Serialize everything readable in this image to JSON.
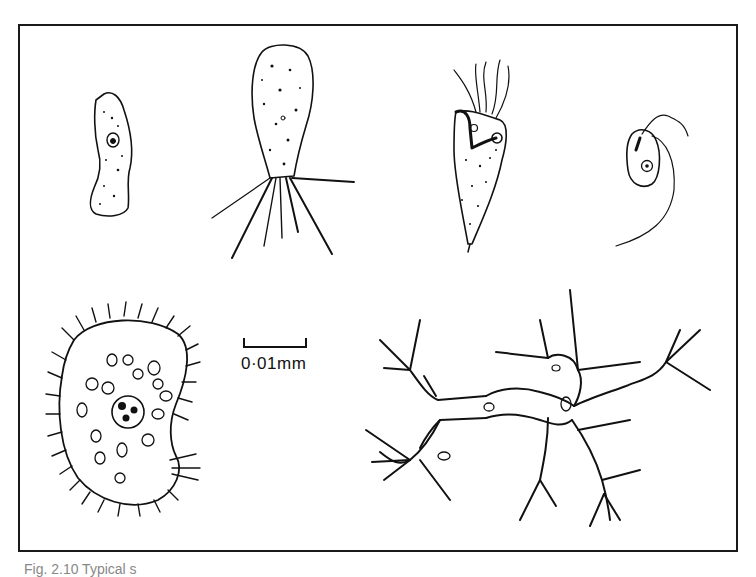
{
  "figure": {
    "scale_bar_label": "0·01mm",
    "caption": "Fig. 2.10  Typical s",
    "panels": [
      {
        "name": "amoeboid-cell",
        "position": "top-left"
      },
      {
        "name": "flagellate-with-posterior-flagella",
        "position": "top-center-left"
      },
      {
        "name": "multiflagellate-trichomonad",
        "position": "top-center-right"
      },
      {
        "name": "small-biflagellate",
        "position": "top-right"
      },
      {
        "name": "ciliate",
        "position": "bottom-left"
      },
      {
        "name": "reticulose-plasmodium",
        "position": "bottom-right"
      }
    ],
    "colors": {
      "ink": "#111111",
      "paper": "#ffffff"
    }
  }
}
